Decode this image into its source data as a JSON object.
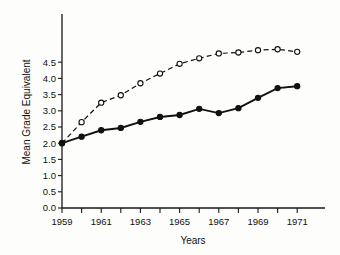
{
  "chart_data": {
    "type": "line",
    "title": "",
    "xlabel": "Years",
    "ylabel": "Mean Grade Equivalent",
    "xlim": [
      1959,
      1972
    ],
    "ylim": [
      0.0,
      5.0
    ],
    "grid": false,
    "legend": "none",
    "x": [
      1959,
      1960,
      1961,
      1962,
      1963,
      1964,
      1965,
      1966,
      1967,
      1968,
      1969,
      1970,
      1971
    ],
    "x_tick_labels": [
      "1959",
      "1961",
      "1963",
      "1965",
      "1967",
      "1969",
      "1971"
    ],
    "x_tick_values": [
      1959,
      1961,
      1963,
      1965,
      1967,
      1969,
      1971
    ],
    "y_tick_labels": [
      "0.0",
      "0.5",
      "1.0",
      "1.5",
      "2.0",
      "2.5",
      "3.0",
      "3.5",
      "4.0",
      "4.5"
    ],
    "y_tick_values": [
      0.0,
      0.5,
      1.0,
      1.5,
      2.0,
      2.5,
      3.0,
      3.5,
      4.0,
      4.5
    ],
    "series": [
      {
        "name": "open-circle-dashed",
        "marker": "open-circle",
        "line_style": "dashed",
        "values": [
          2.0,
          2.65,
          3.25,
          3.48,
          3.85,
          4.15,
          4.45,
          4.62,
          4.77,
          4.8,
          4.87,
          4.9,
          4.82
        ]
      },
      {
        "name": "filled-circle-solid",
        "marker": "filled-circle",
        "line_style": "solid",
        "values": [
          2.0,
          2.2,
          2.4,
          2.47,
          2.66,
          2.81,
          2.87,
          3.06,
          2.93,
          3.08,
          3.4,
          3.7,
          3.76
        ]
      }
    ]
  }
}
